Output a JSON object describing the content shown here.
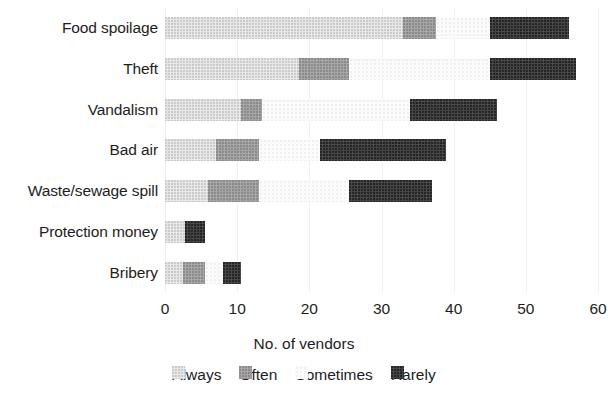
{
  "chart_data": {
    "type": "bar",
    "subtype": "stacked-horizontal",
    "title": "",
    "xlabel": "No. of vendors",
    "ylabel": "",
    "xlim": [
      0,
      60
    ],
    "xticks": [
      0,
      10,
      20,
      30,
      40,
      50,
      60
    ],
    "xtick_labels": [
      "0",
      "10",
      "20",
      "30",
      "40",
      "50",
      "60"
    ],
    "grid": false,
    "legend_position": "bottom",
    "categories": [
      "Food spoilage",
      "Theft",
      "Vandalism",
      "Bad air",
      "Waste/sewage spill",
      "Protection money",
      "Bribery"
    ],
    "series": [
      {
        "name": "Always",
        "color": "#e9e9e9",
        "values": [
          33,
          18.5,
          10.5,
          7,
          6,
          2.8,
          2.5
        ]
      },
      {
        "name": "Often",
        "color": "#a3a3a3",
        "values": [
          4.5,
          7,
          3,
          6,
          7,
          0,
          3
        ]
      },
      {
        "name": "Sometimes",
        "color": "#fbfbfb",
        "values": [
          7.5,
          19.5,
          20.5,
          8.5,
          12.5,
          0,
          2.5
        ]
      },
      {
        "name": "Rarely",
        "color": "#434343",
        "values": [
          11,
          12,
          12,
          17.5,
          11.5,
          2.7,
          2.5
        ]
      }
    ],
    "segment_totals": [
      56,
      57,
      46,
      39,
      37,
      5.5,
      10.5
    ]
  },
  "axis": {
    "title": "No. of vendors"
  },
  "legend": {
    "items": [
      {
        "label": "Always"
      },
      {
        "label": "Often"
      },
      {
        "label": "Sometimes"
      },
      {
        "label": "Rarely"
      }
    ]
  }
}
